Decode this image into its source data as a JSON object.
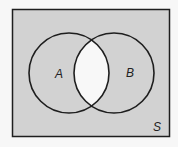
{
  "diagram": {
    "type": "venn",
    "universe_label": "S",
    "sets": [
      {
        "label": "A"
      },
      {
        "label": "B"
      }
    ],
    "shaded_region": "complement of A intersect B",
    "colors": {
      "background": "#f7f7f7",
      "shade": "#d2d2d2",
      "unshaded": "#f8f8f8",
      "stroke": "#1e1e1e"
    }
  }
}
